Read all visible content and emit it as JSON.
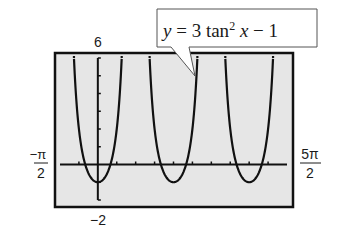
{
  "chart_data": {
    "type": "line",
    "title": "",
    "function": "3*tan(x)^2 - 1",
    "annotation": {
      "parts": [
        "y",
        " = 3 tan",
        "2",
        " x",
        " − 1"
      ],
      "text": "y = 3 tan² x − 1"
    },
    "xlim": [
      -1.5707963,
      7.8539816
    ],
    "ylim": [
      -2,
      6
    ],
    "x_ticks_step": 0.7853982,
    "y_ticks_step": 1,
    "grid": false,
    "xlabel": "",
    "ylabel": "",
    "window_labels": {
      "xmin": {
        "num": "−π",
        "den": "2"
      },
      "xmax": {
        "num": "5π",
        "den": "2"
      },
      "ymax": "6",
      "ymin": "−2"
    },
    "series": [
      {
        "name": "y = 3 tan² x − 1",
        "color": "#111111"
      }
    ],
    "colors": {
      "screen_bg": "#e6e6e6",
      "frame": "#111111",
      "curve": "#111111"
    }
  }
}
